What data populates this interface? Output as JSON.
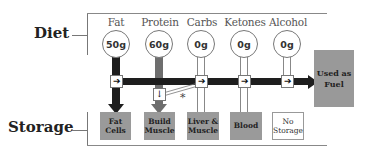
{
  "labels": {
    "diet": "Diet",
    "storage": "Storage"
  },
  "columns": [
    {
      "name": "Fat",
      "amount": "50g",
      "pipe": "dark",
      "storage": "Fat Cells",
      "storage_lines": [
        "Fat",
        "Cells"
      ],
      "storage_filled": true
    },
    {
      "name": "Protein",
      "amount": "60g",
      "pipe": "medium",
      "storage": "Build Muscle",
      "storage_lines": [
        "Build",
        "Muscle"
      ],
      "storage_filled": true
    },
    {
      "name": "Carbs",
      "amount": "0g",
      "pipe": "empty",
      "storage": "Liver & Muscle",
      "storage_lines": [
        "Liver &",
        "Muscle"
      ],
      "storage_filled": true
    },
    {
      "name": "Ketones",
      "amount": "0g",
      "pipe": "empty",
      "storage": "Blood",
      "storage_lines": [
        "Blood",
        ""
      ],
      "storage_filled": true
    },
    {
      "name": "Alcohol",
      "amount": "0g",
      "pipe": "empty",
      "storage": "No Storage",
      "storage_lines": [
        "No",
        "Storage"
      ],
      "storage_filled": false
    }
  ],
  "fuel": {
    "label_lines": [
      "Used as",
      "Fuel"
    ]
  },
  "annotation": {
    "asterisk": "*"
  },
  "icons": {
    "arrow_right": "➔",
    "arrow_down": "🠗"
  },
  "colors": {
    "dark_pipe": "#1e1e1e",
    "medium_pipe": "#6e6e6e",
    "storage_fill": "#9a9a9a",
    "fuel_fill": "#999999"
  }
}
